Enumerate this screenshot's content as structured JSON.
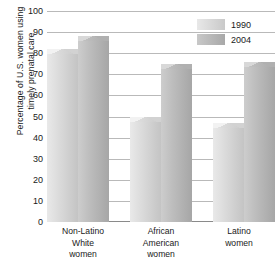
{
  "chart_data": {
    "type": "bar",
    "title": "",
    "xlabel": "",
    "ylabel": "Percentage of U.S. women using\ntimely prenatal care",
    "ylim": [
      0,
      100
    ],
    "ytick_step": 10,
    "yticks": [
      "100",
      "90",
      "80",
      "70",
      "60",
      "50",
      "40",
      "30",
      "20",
      "10",
      "0"
    ],
    "grid": true,
    "legend_position": "top-right",
    "categories": [
      "Non-Latino\nWhite\nwomen",
      "African\nAmerican\nwomen",
      "Latino\nwomen"
    ],
    "series": [
      {
        "name": "1990",
        "color": "#dcdcdc",
        "values": [
          82,
          50,
          47
        ]
      },
      {
        "name": "2004",
        "color": "#b4b4b4",
        "values": [
          88,
          75,
          76
        ]
      }
    ]
  },
  "legend": {
    "items": [
      {
        "label": "1990"
      },
      {
        "label": "2004"
      }
    ]
  }
}
